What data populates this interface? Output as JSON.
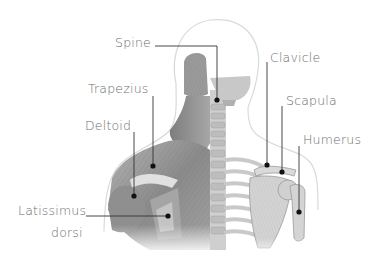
{
  "diagram": {
    "title": "",
    "colors": {
      "label_text": "#6e6e6e",
      "leader_line": "#333333",
      "marker_dot": "#111111",
      "outline": "#dcdcdc",
      "muscle": "#8c8c8c",
      "bone": "#d6d6d6"
    },
    "labels": [
      {
        "id": "spine",
        "text": "Spine",
        "side": "left"
      },
      {
        "id": "trapezius",
        "text": "Trapezius",
        "side": "left"
      },
      {
        "id": "deltoid",
        "text": "Deltoid",
        "side": "left"
      },
      {
        "id": "latissimus",
        "text": "Latissimus",
        "text2": "dorsi",
        "side": "left"
      },
      {
        "id": "clavicle",
        "text": "Clavicle",
        "side": "right"
      },
      {
        "id": "scapula",
        "text": "Scapula",
        "side": "right"
      },
      {
        "id": "humerus",
        "text": "Humerus",
        "side": "right"
      }
    ]
  }
}
